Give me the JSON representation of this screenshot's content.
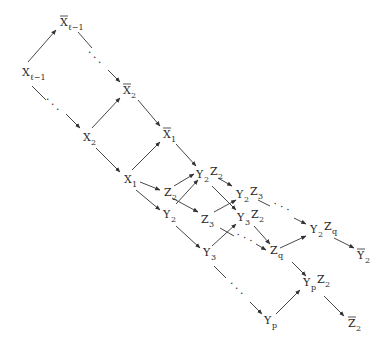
{
  "diagram": {
    "type": "directed-graph",
    "nodes": [
      {
        "id": "Xl1",
        "base": "X",
        "bar": false,
        "sub": "ℓ−1",
        "x": 22,
        "y": 76
      },
      {
        "id": "Xbl1",
        "base": "X",
        "bar": true,
        "sub": "ℓ−1",
        "x": 60,
        "y": 26
      },
      {
        "id": "Xb2",
        "base": "X",
        "bar": true,
        "sub": "2",
        "x": 123,
        "y": 94
      },
      {
        "id": "X2",
        "base": "X",
        "bar": false,
        "sub": "2",
        "x": 83,
        "y": 141
      },
      {
        "id": "Xb1",
        "base": "X",
        "bar": true,
        "sub": "1",
        "x": 163,
        "y": 138
      },
      {
        "id": "X1",
        "base": "X",
        "bar": false,
        "sub": "1",
        "x": 124,
        "y": 183
      },
      {
        "id": "Y2Z2",
        "base": "Y",
        "bar": false,
        "sub": "2",
        "base2": "Z",
        "sub2": "2",
        "x": 196,
        "y": 178
      },
      {
        "id": "Z2",
        "base": "Z",
        "bar": false,
        "sub": "2",
        "x": 164,
        "y": 196
      },
      {
        "id": "Y2Z3",
        "base": "Y",
        "bar": false,
        "sub": "2",
        "base2": "Z",
        "sub2": "3",
        "x": 236,
        "y": 198
      },
      {
        "id": "Y2",
        "base": "Y",
        "bar": false,
        "sub": "2",
        "x": 163,
        "y": 218
      },
      {
        "id": "Z3",
        "base": "Z",
        "bar": false,
        "sub": "3",
        "x": 201,
        "y": 223
      },
      {
        "id": "Y3Z2",
        "base": "Y",
        "bar": false,
        "sub": "3",
        "base2": "Z",
        "sub2": "2",
        "x": 237,
        "y": 221
      },
      {
        "id": "Zq",
        "base": "Z",
        "bar": false,
        "sub": "q",
        "x": 270,
        "y": 254
      },
      {
        "id": "Y3",
        "base": "Y",
        "bar": false,
        "sub": "3",
        "x": 203,
        "y": 256
      },
      {
        "id": "Y2Zq",
        "base": "Y",
        "bar": false,
        "sub": "2",
        "base2": "Z",
        "sub2": "q",
        "x": 310,
        "y": 233
      },
      {
        "id": "Yb2",
        "base": "Y",
        "bar": true,
        "sub": "2",
        "x": 357,
        "y": 259
      },
      {
        "id": "YpZ2",
        "base": "Y",
        "bar": false,
        "sub": "p",
        "base2": "Z",
        "sub2": "2",
        "x": 303,
        "y": 286
      },
      {
        "id": "Yp",
        "base": "Y",
        "bar": false,
        "sub": "p",
        "x": 264,
        "y": 324
      },
      {
        "id": "Zb2",
        "base": "Z",
        "bar": true,
        "sub": "2",
        "x": 348,
        "y": 327
      }
    ],
    "edges": [
      {
        "from": "Xl1",
        "to": "Xbl1",
        "x1": 28,
        "y1": 62,
        "x2": 56,
        "y2": 30,
        "style": "solid"
      },
      {
        "from": "Xbl1",
        "to": "Xb2",
        "x1": 78,
        "y1": 32,
        "x2": 92,
        "y2": 48,
        "style": "solid-start"
      },
      {
        "from": "Xbl1",
        "to": "Xb2",
        "x1": 108,
        "y1": 70,
        "x2": 120,
        "y2": 82,
        "style": "arrow-end"
      },
      {
        "from": "Xl1",
        "to": "X2",
        "x1": 32,
        "y1": 86,
        "x2": 46,
        "y2": 100,
        "style": "solid-start"
      },
      {
        "from": "Xl1",
        "to": "X2",
        "x1": 66,
        "y1": 114,
        "x2": 80,
        "y2": 128,
        "style": "arrow-end"
      },
      {
        "from": "X2",
        "to": "Xb2",
        "x1": 92,
        "y1": 128,
        "x2": 120,
        "y2": 98,
        "style": "solid"
      },
      {
        "from": "X2",
        "to": "X1",
        "x1": 96,
        "y1": 148,
        "x2": 120,
        "y2": 172,
        "style": "solid"
      },
      {
        "from": "Xb2",
        "to": "Xb1",
        "x1": 138,
        "y1": 100,
        "x2": 160,
        "y2": 126,
        "style": "solid"
      },
      {
        "from": "X1",
        "to": "Xb1",
        "x1": 132,
        "y1": 170,
        "x2": 160,
        "y2": 142,
        "style": "solid"
      },
      {
        "from": "Xb1",
        "to": "Y2Z2",
        "x1": 176,
        "y1": 144,
        "x2": 196,
        "y2": 166,
        "style": "solid"
      },
      {
        "from": "X1",
        "to": "Z2",
        "x1": 140,
        "y1": 182,
        "x2": 160,
        "y2": 190,
        "style": "solid"
      },
      {
        "from": "X1",
        "to": "Y2",
        "x1": 136,
        "y1": 190,
        "x2": 160,
        "y2": 210,
        "style": "solid"
      },
      {
        "from": "Z2",
        "to": "Y2Z2",
        "x1": 174,
        "y1": 186,
        "x2": 194,
        "y2": 174,
        "style": "solid"
      },
      {
        "from": "Y2",
        "to": "Y2Z2",
        "x1": 176,
        "y1": 204,
        "x2": 198,
        "y2": 180,
        "style": "solid"
      },
      {
        "from": "Z2",
        "to": "Z3",
        "x1": 172,
        "y1": 198,
        "x2": 198,
        "y2": 212,
        "style": "solid"
      },
      {
        "from": "Y2Z2",
        "to": "Y2Z3",
        "x1": 218,
        "y1": 178,
        "x2": 232,
        "y2": 186,
        "style": "solid"
      },
      {
        "from": "Y2Z2",
        "to": "Y3Z2",
        "x1": 212,
        "y1": 186,
        "x2": 236,
        "y2": 210,
        "style": "solid"
      },
      {
        "from": "Z3",
        "to": "Y2Z3",
        "x1": 214,
        "y1": 212,
        "x2": 236,
        "y2": 200,
        "style": "solid"
      },
      {
        "from": "Y2",
        "to": "Y3",
        "x1": 176,
        "y1": 226,
        "x2": 200,
        "y2": 248,
        "style": "solid"
      },
      {
        "from": "Y3",
        "to": "Y3Z2",
        "x1": 212,
        "y1": 246,
        "x2": 236,
        "y2": 224,
        "style": "solid"
      },
      {
        "from": "Z3",
        "to": "Zq",
        "x1": 220,
        "y1": 228,
        "x2": 234,
        "y2": 236,
        "style": "solid-start"
      },
      {
        "from": "Z3",
        "to": "Zq",
        "x1": 256,
        "y1": 244,
        "x2": 266,
        "y2": 250,
        "style": "arrow-end"
      },
      {
        "from": "Y2Z3",
        "to": "Y2Zq",
        "x1": 258,
        "y1": 200,
        "x2": 270,
        "y2": 206,
        "style": "solid-start"
      },
      {
        "from": "Y2Z3",
        "to": "Y2Zq",
        "x1": 294,
        "y1": 218,
        "x2": 306,
        "y2": 224,
        "style": "arrow-end"
      },
      {
        "from": "Y3Z2",
        "to": "Zq",
        "x1": 254,
        "y1": 226,
        "x2": 270,
        "y2": 244,
        "style": "solid"
      },
      {
        "from": "Zq",
        "to": "Y2Zq",
        "x1": 280,
        "y1": 248,
        "x2": 306,
        "y2": 236,
        "style": "solid"
      },
      {
        "from": "Y2Zq",
        "to": "Yb2",
        "x1": 334,
        "y1": 238,
        "x2": 354,
        "y2": 248,
        "style": "solid"
      },
      {
        "from": "Zq",
        "to": "YpZ2",
        "x1": 292,
        "y1": 262,
        "x2": 306,
        "y2": 276,
        "style": "solid"
      },
      {
        "from": "Y3",
        "to": "Yp",
        "x1": 214,
        "y1": 266,
        "x2": 226,
        "y2": 278,
        "style": "solid-start"
      },
      {
        "from": "Y3",
        "to": "Yp",
        "x1": 250,
        "y1": 302,
        "x2": 262,
        "y2": 314,
        "style": "arrow-end"
      },
      {
        "from": "Yp",
        "to": "YpZ2",
        "x1": 276,
        "y1": 314,
        "x2": 300,
        "y2": 290,
        "style": "solid"
      },
      {
        "from": "YpZ2",
        "to": "Zb2",
        "x1": 324,
        "y1": 296,
        "x2": 344,
        "y2": 316,
        "style": "solid"
      }
    ],
    "ellipses": [
      {
        "x": 92,
        "y": 60,
        "text": "·  ·  ·",
        "rotate": 45
      },
      {
        "x": 50,
        "y": 107,
        "text": "·  ·  ·",
        "rotate": 45
      },
      {
        "x": 280,
        "y": 210,
        "text": "·  ·  ·",
        "rotate": 25
      },
      {
        "x": 243,
        "y": 241,
        "text": "·  ·  ·",
        "rotate": 25
      },
      {
        "x": 234,
        "y": 291,
        "text": "·  ·  ·",
        "rotate": 45
      }
    ]
  }
}
